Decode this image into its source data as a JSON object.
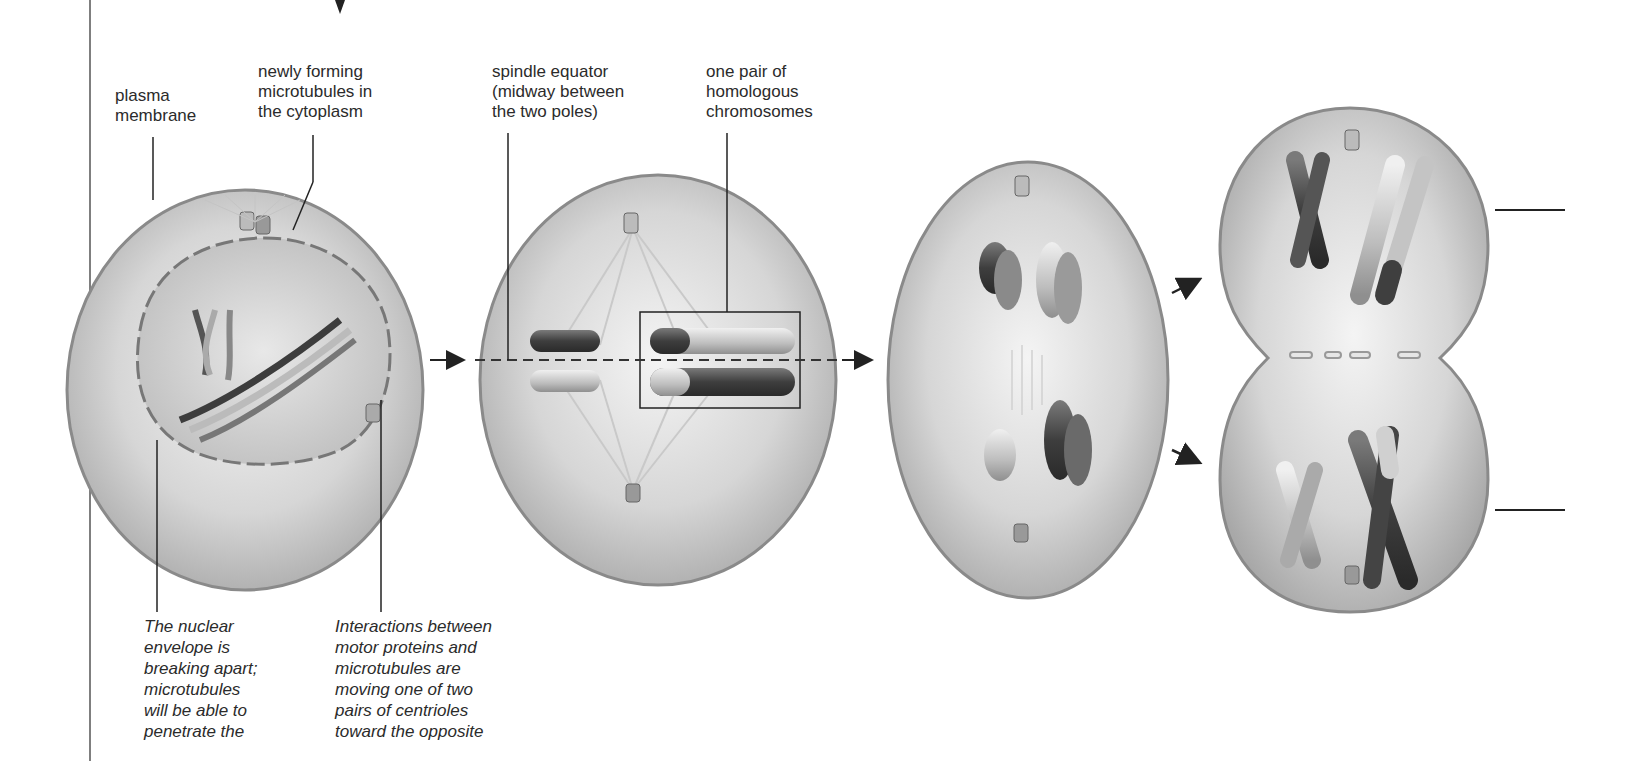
{
  "labels": {
    "plasma_membrane": [
      "plasma",
      "membrane"
    ],
    "microtubules": [
      "newly forming",
      "microtubules in",
      "the cytoplasm"
    ],
    "spindle_equator": [
      "spindle equator",
      "(midway between",
      "the two poles)"
    ],
    "homologous_pair": [
      "one pair of",
      "homologous",
      "chromosomes"
    ]
  },
  "captions": {
    "nuclear_envelope": [
      "The nuclear",
      "envelope is",
      "breaking apart;",
      "microtubules",
      "will be able to",
      "penetrate the"
    ],
    "motor_proteins": [
      "Interactions between",
      "motor proteins and",
      "microtubules are",
      "moving one of two",
      "pairs of centrioles",
      "toward the opposite"
    ]
  },
  "colors": {
    "cell_fill": "#d9d9d9",
    "cell_edge": "#8a8a8a",
    "chromosome_dark": "#4a4a4a",
    "chromosome_light": "#c8c8c8",
    "line": "#222222"
  },
  "stages": [
    "prophase-cell",
    "metaphase-cell",
    "anaphase-cell",
    "telophase-cell"
  ]
}
